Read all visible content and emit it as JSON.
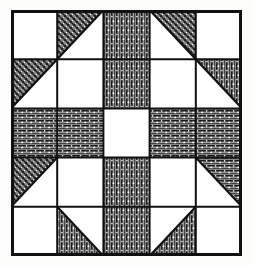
{
  "figure": {
    "name": "quilt-block-diagram",
    "kind": "patchwork-quilt-block",
    "grid_rows": 5,
    "grid_cols": 5,
    "background_color": "#fcfcfa",
    "ink_color": "#111111",
    "patch_fill_color": "#8a8a8a",
    "blank_color": "#ffffff",
    "border_width_px": 3,
    "grid_line_width_px": 2,
    "block_x_px": 11,
    "block_y_px": 10,
    "block_w_px": 231,
    "block_h_px": 246
  },
  "textures": {
    "crosshatch": "diagonal-crosshatch-speckled",
    "vertical": "vertical-line-hatch-speckled",
    "horizontal": "horizontal-line-hatch-speckled",
    "blank": "plain-white"
  },
  "chart_data": {
    "type": "table",
    "title": "",
    "xlabel": "",
    "ylabel": "",
    "rows": 5,
    "cols": 5,
    "legend": [
      {
        "key": "blank",
        "label": "plain white patch"
      },
      {
        "key": "crosshatch",
        "label": "crosshatch shaded patch"
      },
      {
        "key": "vertical",
        "label": "vertical hatch shaded patch"
      },
      {
        "key": "horizontal",
        "label": "horizontal hatch shaded patch"
      }
    ],
    "shapes": [
      "square",
      "triangle-ul",
      "triangle-ur",
      "triangle-ll",
      "triangle-lr"
    ],
    "cells": [
      [
        {
          "r": 0,
          "c": 0,
          "shape": "square",
          "texture": "blank"
        },
        {
          "r": 0,
          "c": 1,
          "shape": "triangle-ul",
          "texture": "crosshatch"
        },
        {
          "r": 0,
          "c": 2,
          "shape": "square",
          "texture": "vertical"
        },
        {
          "r": 0,
          "c": 3,
          "shape": "triangle-ur",
          "texture": "crosshatch"
        },
        {
          "r": 0,
          "c": 4,
          "shape": "square",
          "texture": "blank"
        }
      ],
      [
        {
          "r": 1,
          "c": 0,
          "shape": "triangle-ul",
          "texture": "crosshatch"
        },
        {
          "r": 1,
          "c": 1,
          "shape": "square",
          "texture": "blank"
        },
        {
          "r": 1,
          "c": 2,
          "shape": "square",
          "texture": "vertical"
        },
        {
          "r": 1,
          "c": 3,
          "shape": "square",
          "texture": "blank"
        },
        {
          "r": 1,
          "c": 4,
          "shape": "triangle-ur",
          "texture": "vertical"
        }
      ],
      [
        {
          "r": 2,
          "c": 0,
          "shape": "square",
          "texture": "horizontal"
        },
        {
          "r": 2,
          "c": 1,
          "shape": "square",
          "texture": "horizontal"
        },
        {
          "r": 2,
          "c": 2,
          "shape": "square",
          "texture": "blank"
        },
        {
          "r": 2,
          "c": 3,
          "shape": "square",
          "texture": "horizontal"
        },
        {
          "r": 2,
          "c": 4,
          "shape": "square",
          "texture": "horizontal"
        }
      ],
      [
        {
          "r": 3,
          "c": 0,
          "shape": "triangle-ul",
          "texture": "crosshatch"
        },
        {
          "r": 3,
          "c": 1,
          "shape": "square",
          "texture": "blank"
        },
        {
          "r": 3,
          "c": 2,
          "shape": "square",
          "texture": "vertical"
        },
        {
          "r": 3,
          "c": 3,
          "shape": "square",
          "texture": "blank"
        },
        {
          "r": 3,
          "c": 4,
          "shape": "triangle-ur",
          "texture": "horizontal"
        }
      ],
      [
        {
          "r": 4,
          "c": 0,
          "shape": "square",
          "texture": "blank"
        },
        {
          "r": 4,
          "c": 1,
          "shape": "triangle-ll",
          "texture": "vertical"
        },
        {
          "r": 4,
          "c": 2,
          "shape": "square",
          "texture": "vertical"
        },
        {
          "r": 4,
          "c": 3,
          "shape": "triangle-lr",
          "texture": "vertical"
        },
        {
          "r": 4,
          "c": 4,
          "shape": "square",
          "texture": "blank"
        }
      ]
    ]
  }
}
